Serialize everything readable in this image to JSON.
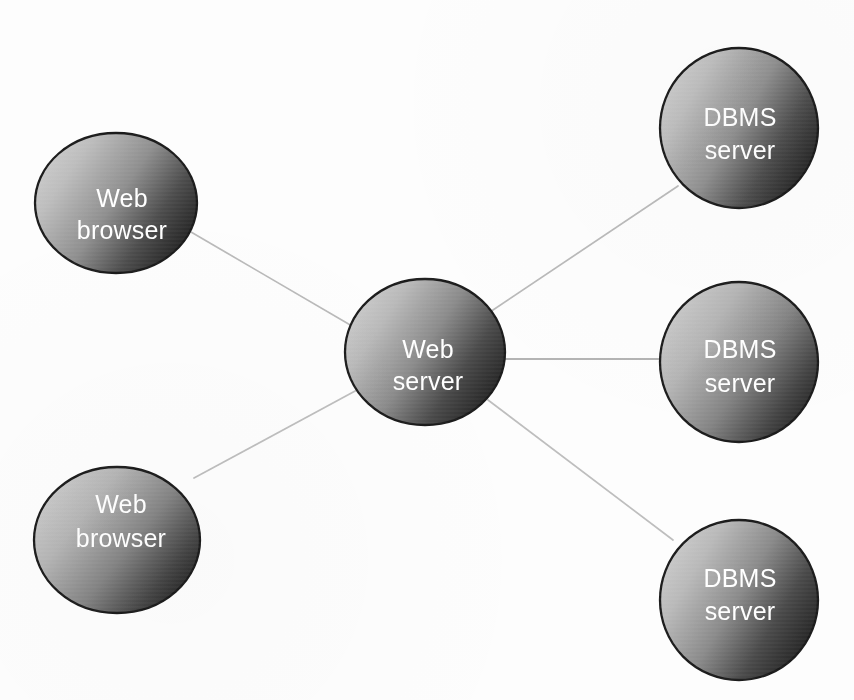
{
  "diagram": {
    "background_color": "#fdfdfd",
    "node_border_color": "#1b1b1b",
    "node_text_color": "#ffffff",
    "edge_color": "#b9b9b9",
    "gradient_light": "#c9c9c9",
    "gradient_dark": "#2f2f2f",
    "nodes": [
      {
        "id": "web-browser-top",
        "line1": "Web",
        "line2": "browser",
        "cx": 116,
        "cy": 203,
        "rx": 81,
        "ry": 70
      },
      {
        "id": "web-browser-bottom",
        "line1": "Web",
        "line2": "browser",
        "cx": 117,
        "cy": 540,
        "rx": 83,
        "ry": 73
      },
      {
        "id": "web-server",
        "line1": "Web",
        "line2": "server",
        "cx": 425,
        "cy": 352,
        "rx": 80,
        "ry": 73
      },
      {
        "id": "dbms-server-top",
        "line1": "DBMS",
        "line2": "server",
        "cx": 739,
        "cy": 128,
        "rx": 79,
        "ry": 80
      },
      {
        "id": "dbms-server-middle",
        "line1": "DBMS",
        "line2": "server",
        "cx": 739,
        "cy": 362,
        "rx": 79,
        "ry": 80
      },
      {
        "id": "dbms-server-bottom",
        "line1": "DBMS",
        "line2": "server",
        "cx": 739,
        "cy": 600,
        "rx": 79,
        "ry": 80
      }
    ],
    "edges": [
      {
        "id": "edge-browser-top-to-web-server",
        "x1": 191,
        "y1": 232,
        "x2": 352,
        "y2": 326
      },
      {
        "id": "edge-browser-bottom-to-web-server",
        "x1": 194,
        "y1": 478,
        "x2": 357,
        "y2": 390
      },
      {
        "id": "edge-web-server-to-dbms-top",
        "x1": 490,
        "y1": 312,
        "x2": 678,
        "y2": 186
      },
      {
        "id": "edge-web-server-to-dbms-middle",
        "x1": 505,
        "y1": 359,
        "x2": 660,
        "y2": 359
      },
      {
        "id": "edge-web-server-to-dbms-bottom",
        "x1": 488,
        "y1": 400,
        "x2": 673,
        "y2": 540
      }
    ]
  }
}
